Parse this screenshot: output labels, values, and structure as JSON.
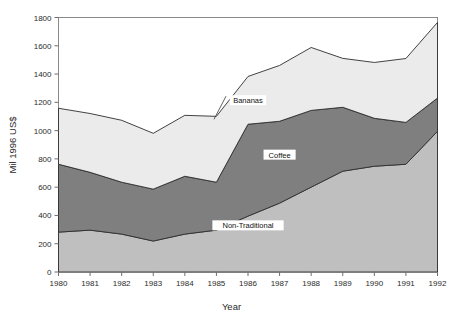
{
  "chart_data": {
    "type": "area",
    "stacked": true,
    "title": "",
    "xlabel": "Year",
    "ylabel": "Mil 1996 US$",
    "categories": [
      1980,
      1981,
      1982,
      1983,
      1984,
      1985,
      1986,
      1987,
      1988,
      1989,
      1990,
      1991,
      1992
    ],
    "xtick_labels": [
      "1980",
      "1981",
      "1982",
      "1983",
      "1984",
      "1985",
      "1986",
      "1987",
      "1988",
      "1989",
      "1990",
      "1991",
      "1992"
    ],
    "ytick_labels": [
      "0",
      "200",
      "400",
      "600",
      "800",
      "1000",
      "1200",
      "1400",
      "1600",
      "1800"
    ],
    "ytick_values": [
      0,
      200,
      400,
      600,
      800,
      1000,
      1200,
      1400,
      1600,
      1800
    ],
    "xlim": [
      1980,
      1992
    ],
    "ylim": [
      0,
      1800
    ],
    "grid": false,
    "legend": "inline-annotations",
    "series": [
      {
        "name": "Non-Traditional",
        "color": "#bfbfbf",
        "values": [
          282,
          296,
          268,
          219,
          268,
          296,
          395,
          487,
          600,
          713,
          748,
          762,
          995
        ]
      },
      {
        "name": "Coffee",
        "color": "#7f7f7f",
        "values": [
          480,
          409,
          367,
          367,
          409,
          339,
          650,
          579,
          543,
          452,
          339,
          296,
          235
        ]
      },
      {
        "name": "Bananas",
        "color": "#ebebeb",
        "values": [
          396,
          416,
          438,
          395,
          431,
          466,
          338,
          395,
          445,
          346,
          395,
          452,
          535
        ]
      }
    ],
    "cumulative_totals": [
      1158,
      1121,
      1073,
      981,
      1108,
      1101,
      1383,
      1461,
      1588,
      1511,
      1482,
      1510,
      1765
    ],
    "annotations": [
      {
        "label": "Bananas",
        "x": 1986,
        "y": 1215
      },
      {
        "label": "Coffee",
        "x": 1987,
        "y": 830
      },
      {
        "label": "Non-Traditional",
        "x": 1986,
        "y": 330
      }
    ]
  },
  "axes": {
    "x_title": "Year",
    "y_title": "Mil 1996 US$"
  }
}
